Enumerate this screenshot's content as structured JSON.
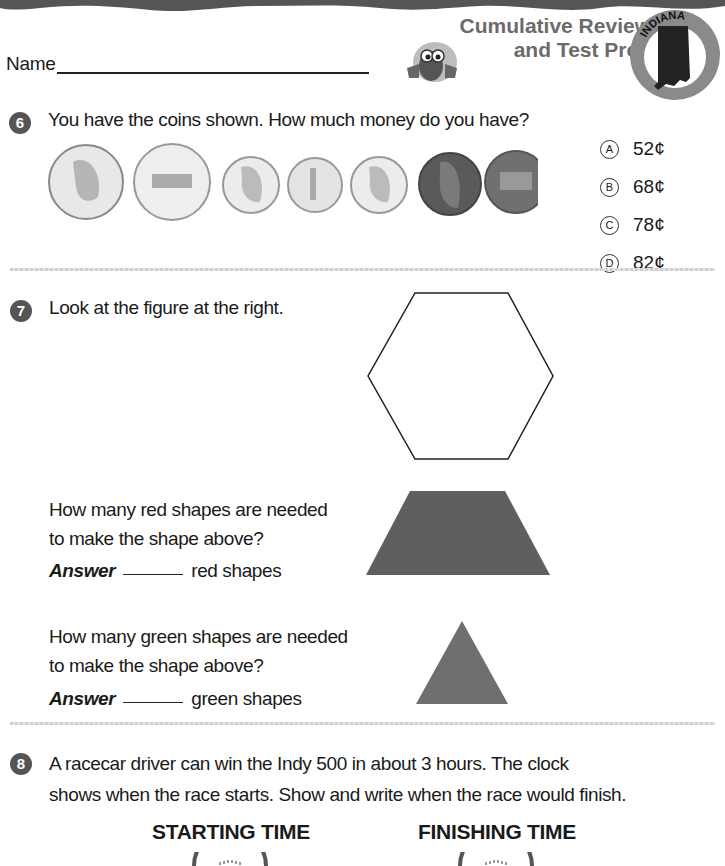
{
  "header": {
    "name_label": "Name",
    "title_line1": "Cumulative Review",
    "title_line2": "and Test Prep",
    "state_badge": "INDIANA",
    "colors": {
      "title": "#6b6b6b",
      "wave": "#555555",
      "badge_ring": "#8a8a8a",
      "state_fill": "#222222"
    }
  },
  "questions": [
    {
      "number": "6",
      "prompt": "You have the coins shown. How much money do you have?",
      "coins": [
        "quarter",
        "quarter-indiana",
        "dime",
        "dime",
        "dime",
        "penny",
        "penny"
      ],
      "options": [
        {
          "letter": "A",
          "label": "52¢"
        },
        {
          "letter": "B",
          "label": "68¢"
        },
        {
          "letter": "C",
          "label": "78¢"
        },
        {
          "letter": "D",
          "label": "82¢"
        }
      ]
    },
    {
      "number": "7",
      "prompt": "Look at the figure at the right.",
      "parts": [
        {
          "question_line1": "How many red shapes are needed",
          "question_line2": "to make the shape above?",
          "answer_label": "Answer",
          "answer_suffix": "red shapes",
          "shape": "trapezoid"
        },
        {
          "question_line1": "How many green shapes are needed",
          "question_line2": "to make the shape above?",
          "answer_label": "Answer",
          "answer_suffix": "green shapes",
          "shape": "triangle"
        }
      ],
      "figure": "hexagon"
    },
    {
      "number": "8",
      "prompt_line1": "A racecar driver can win the Indy 500 in about 3 hours. The clock",
      "prompt_line2": "shows when the race starts. Show and write when the race would finish.",
      "clock_labels": {
        "start": "STARTING TIME",
        "finish": "FINISHING TIME"
      }
    }
  ]
}
